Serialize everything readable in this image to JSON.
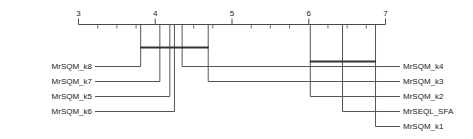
{
  "chart_data": {
    "type": "line",
    "chart_kind": "critical-difference-diagram",
    "title": "",
    "subtitle": "",
    "xlabel": "",
    "ylabel": "",
    "axis": {
      "orientation": "horizontal-top",
      "direction": "left-is-better",
      "xlim": [
        3,
        7
      ],
      "major_ticks": [
        3,
        4,
        5,
        6,
        7
      ],
      "major_tick_labels": [
        "3",
        "4",
        "5",
        "6",
        "7"
      ],
      "minor_ticks": [
        3.25,
        3.5,
        3.75,
        4.25,
        4.5,
        4.75,
        5.25,
        5.5,
        5.75,
        6.25,
        6.5,
        6.75
      ],
      "grid": false,
      "legend": "none"
    },
    "categories": [
      "MrSQM_k8",
      "MrSQM_k7",
      "MrSQM_k5",
      "MrSQM_k6",
      "MrSQM_k4",
      "MrSQM_k3",
      "MrSQM_k2",
      "MrSEQL_SFA",
      "MrSQM_k1"
    ],
    "values": [
      3.81,
      4.06,
      4.19,
      4.25,
      4.35,
      4.69,
      6.02,
      6.44,
      6.87
    ],
    "points": [
      {
        "label": "MrSQM_k8",
        "rank": 3.81,
        "side": "left",
        "slot": 0
      },
      {
        "label": "MrSQM_k7",
        "rank": 4.06,
        "side": "left",
        "slot": 1
      },
      {
        "label": "MrSQM_k5",
        "rank": 4.19,
        "side": "left",
        "slot": 2
      },
      {
        "label": "MrSQM_k6",
        "rank": 4.25,
        "side": "left",
        "slot": 3
      },
      {
        "label": "MrSQM_k4",
        "rank": 4.35,
        "side": "right",
        "slot": 0
      },
      {
        "label": "MrSQM_k3",
        "rank": 4.69,
        "side": "right",
        "slot": 1
      },
      {
        "label": "MrSQM_k2",
        "rank": 6.02,
        "side": "right",
        "slot": 2
      },
      {
        "label": "MrSEQL_SFA",
        "rank": 6.44,
        "side": "right",
        "slot": 3
      },
      {
        "label": "MrSQM_k1",
        "rank": 6.87,
        "side": "right",
        "slot": 4
      }
    ],
    "cliques": [
      {
        "start": 3.81,
        "end": 4.69,
        "members": [
          "MrSQM_k8",
          "MrSQM_k7",
          "MrSQM_k5",
          "MrSQM_k6",
          "MrSQM_k4",
          "MrSQM_k3"
        ]
      },
      {
        "start": 6.02,
        "end": 6.87,
        "members": [
          "MrSQM_k2",
          "MrSEQL_SFA",
          "MrSQM_k1"
        ]
      }
    ],
    "colors": {
      "axis": "#4a4a4a",
      "connector": "#555555",
      "clique": "#333333",
      "text": "#222222",
      "background": "#ffffff"
    }
  }
}
